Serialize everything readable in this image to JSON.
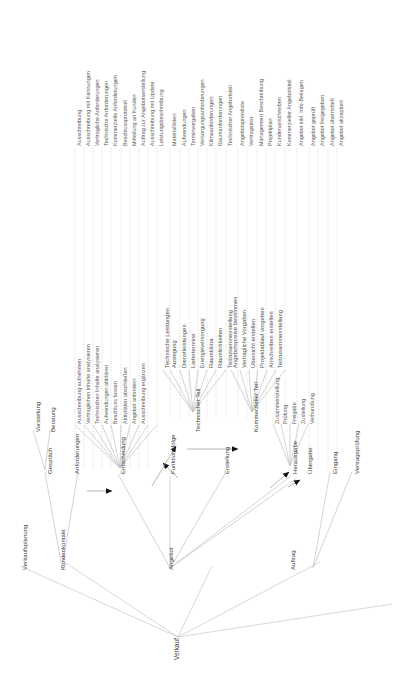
{
  "meta": {
    "title": "Verkauf",
    "orientation": "rotated-90-ccw",
    "language": "de"
  },
  "diagram": {
    "type": "tree",
    "root": "Verkauf",
    "levels": [
      "Verkauf",
      "Hauptprozess",
      "Teilprozess",
      "Aktivitaet",
      "Ergebnis"
    ],
    "nodes": {
      "root": {
        "label": "Verkauf",
        "x": 172,
        "y": 660
      },
      "level1": [
        {
          "id": "verkaufsplanung",
          "label": "Verkaufsplanung",
          "x": 20,
          "y": 570
        },
        {
          "id": "kundenkontakt",
          "label": "Kundenkontakt",
          "x": 58,
          "y": 570
        },
        {
          "id": "angebot",
          "label": "Angebot",
          "x": 166,
          "y": 570
        },
        {
          "id": "auftrag",
          "label": "Auftrag",
          "x": 288,
          "y": 570
        }
      ],
      "level2": [
        {
          "id": "gespraech",
          "label": "Gespräch",
          "x": 45,
          "y": 474
        },
        {
          "id": "anforderungen",
          "label": "Anforderungen",
          "x": 72,
          "y": 474
        },
        {
          "id": "entscheidung",
          "label": "Entscheidung",
          "x": 118,
          "y": 474
        },
        {
          "id": "funktionsfolge",
          "label": "Funktionsfolge",
          "x": 168,
          "y": 474
        },
        {
          "id": "erstellung",
          "label": "Erstellung",
          "x": 222,
          "y": 474
        },
        {
          "id": "herausgabe",
          "label": "Herausgabe",
          "x": 290,
          "y": 474
        },
        {
          "id": "uebergabe",
          "label": "Übergabe",
          "x": 305,
          "y": 474
        },
        {
          "id": "eingang",
          "label": "Eingang",
          "x": 330,
          "y": 474
        },
        {
          "id": "vertragspruefung",
          "label": "Vertragsprüfung",
          "x": 352,
          "y": 474
        }
      ],
      "level3": [
        {
          "id": "vorstellung",
          "label": "Vorstellung",
          "x": 33,
          "y": 432
        },
        {
          "id": "beratung",
          "label": "Beratung",
          "x": 48,
          "y": 432
        },
        {
          "id": "technischer_teil",
          "label": "Technischer Teil",
          "x": 193,
          "y": 432
        },
        {
          "id": "kommerzieller_teil",
          "label": "Kommerzieller Teil",
          "x": 251,
          "y": 432
        }
      ]
    },
    "activities": {
      "entscheidung": [
        "Ausschreibung aufnehmen",
        "Vertraglichen Inhalte analysieren",
        "Technischen Inhalte analysieren",
        "Aufwendungen abklären",
        "Beschluss fassen",
        "Aktivitäten abschließen",
        "Angebot anfordern",
        "Ausschreibung ergänzen"
      ],
      "technischer_teil": [
        "Technische Leistungen",
        "Auslegung",
        "Dienstleistungen",
        "Liefertermine",
        "Energieversorgung",
        "Raumklima",
        "Räumlichkeiten",
        "Teilzusammenstellung"
      ],
      "kommerzieller_teil": [
        "Angebotspreise bestimmen",
        "Vertragliche Vorgaben",
        "Übersicht erstellen",
        "Projektablauf vorgeben",
        "Anschreiben erstellen",
        "Teilzusammenstellung"
      ],
      "herausgabe": [
        "Zusammenstellung",
        "Prüfung",
        "Freigabe",
        "Zustellung",
        "Verhandlung"
      ]
    },
    "results": [
      {
        "label": "Ausschreibung",
        "x": 75
      },
      {
        "label": "Ausschreibung mit Kennungen",
        "x": 84
      },
      {
        "label": "Vertragliche Anforderungen",
        "x": 93
      },
      {
        "label": "Technische Anforderungen",
        "x": 102
      },
      {
        "label": "Kommerzielle Anforderungen",
        "x": 111
      },
      {
        "label": "Beschlussprotokoll",
        "x": 121
      },
      {
        "label": "Mitteilung an Kunden",
        "x": 130
      },
      {
        "label": "Auftrag zur Angebotserstellung",
        "x": 139
      },
      {
        "label": "Ausschreibung mit Update",
        "x": 148
      },
      {
        "label": "Leistungsbeschreibung",
        "x": 157
      },
      {
        "label": "Materiallisten",
        "x": 170
      },
      {
        "label": "Aufwendungen",
        "x": 180
      },
      {
        "label": "Terminvorgaben",
        "x": 189
      },
      {
        "label": "Versorgungsanforderungen",
        "x": 198
      },
      {
        "label": "Klimaanforderungen",
        "x": 207
      },
      {
        "label": "Raumanforderungen",
        "x": 216
      },
      {
        "label": "Technischer Angebotsteil",
        "x": 226
      },
      {
        "label": "Angebotspreisliste",
        "x": 238
      },
      {
        "label": "Vertragstext",
        "x": 247
      },
      {
        "label": "Management Beschreibung",
        "x": 257
      },
      {
        "label": "Projektplan",
        "x": 266
      },
      {
        "label": "Kundenanschreiben",
        "x": 275
      },
      {
        "label": "Kommerzieller Angebotsteil",
        "x": 285
      },
      {
        "label": "Angebot inkl. Info-Beilagen",
        "x": 297
      },
      {
        "label": "Angebot geprüft",
        "x": 309
      },
      {
        "label": "Angebot freigegeben",
        "x": 318
      },
      {
        "label": "Angebot übermittelt",
        "x": 328
      },
      {
        "label": "Angebot akzeptiert",
        "x": 337
      }
    ]
  },
  "colors": {
    "text": "#5a5a5a",
    "node_text": "#3a3a3a",
    "edge": "#b9b9b9",
    "dashed": "#c8c8c8",
    "arrow": "#111111",
    "background": "#ffffff"
  }
}
